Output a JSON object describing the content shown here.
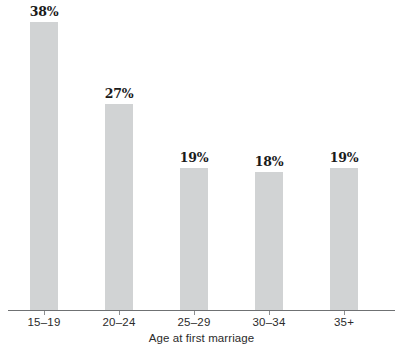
{
  "chart_data": {
    "type": "bar",
    "title": "",
    "xlabel": "Age at first marriage",
    "ylabel": "",
    "categories": [
      "15–19",
      "20–24",
      "25–29",
      "30–34",
      "35+"
    ],
    "values": [
      38,
      27,
      19,
      18,
      19
    ],
    "value_labels": [
      "38%",
      "27%",
      "19%",
      "18%",
      "19%"
    ],
    "unit": "%",
    "ylim": [
      0,
      38
    ],
    "grid": false,
    "legend": false,
    "bar_color": "#d1d3d4",
    "axis_color": "#6f7173",
    "label_color": "#1a1a1a",
    "bars": [
      {
        "category": "15–19",
        "value": 38,
        "label": "38%",
        "center_x": 44,
        "width": 28,
        "pixel_height": 288
      },
      {
        "category": "20–24",
        "value": 27,
        "label": "27%",
        "center_x": 119,
        "width": 28,
        "pixel_height": 206
      },
      {
        "category": "25–29",
        "value": 19,
        "label": "19%",
        "center_x": 194,
        "width": 28,
        "pixel_height": 142
      },
      {
        "category": "30–34",
        "value": 18,
        "label": "18%",
        "center_x": 269,
        "width": 28,
        "pixel_height": 138
      },
      {
        "category": "35+",
        "value": 19,
        "label": "19%",
        "center_x": 344,
        "width": 28,
        "pixel_height": 142
      }
    ]
  },
  "axis": {
    "title": "Age at first marriage"
  }
}
